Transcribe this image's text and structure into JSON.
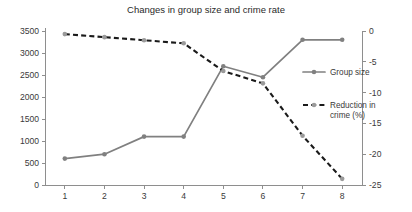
{
  "chart_data": {
    "type": "line",
    "title": "Changes in group size and crime rate",
    "xlabel": "",
    "ylabel": "",
    "x": [
      1,
      2,
      3,
      4,
      5,
      6,
      7,
      8
    ],
    "xtick_labels": [
      "1",
      "2",
      "3",
      "4",
      "5",
      "6",
      "7",
      "8"
    ],
    "grid": false,
    "legend_position": "right",
    "axes": {
      "left": {
        "label": "",
        "ylim": [
          0,
          3500
        ],
        "ticks": [
          0,
          500,
          1000,
          1500,
          2000,
          2500,
          3000,
          3500
        ],
        "tick_labels": [
          "0",
          "500",
          "1000",
          "1500",
          "2000",
          "2500",
          "3000",
          "3500"
        ]
      },
      "right": {
        "label": "",
        "ylim": [
          -25,
          0
        ],
        "ticks": [
          -25,
          -20,
          -15,
          -10,
          -5,
          0
        ],
        "tick_labels": [
          "-25",
          "-20",
          "-15",
          "-10",
          "-5",
          "0"
        ]
      }
    },
    "series": [
      {
        "name": "Group size",
        "axis": "left",
        "style": "solid",
        "color": "#808080",
        "marker": "circle",
        "values": [
          600,
          700,
          1100,
          1100,
          2700,
          2450,
          3300,
          3300
        ]
      },
      {
        "name": "Reduction in crime (%)",
        "axis": "right",
        "style": "dashed",
        "color": "#1a1a1a",
        "marker": "circle",
        "values": [
          -0.5,
          -1.0,
          -1.5,
          -2.0,
          -6.5,
          -8.5,
          -17.0,
          -24.0
        ]
      }
    ],
    "legend": [
      {
        "label": "Group size",
        "style": "solid",
        "color": "#808080"
      },
      {
        "label": "Reduction in crime (%)",
        "style": "dashed",
        "color": "#1a1a1a"
      }
    ]
  }
}
